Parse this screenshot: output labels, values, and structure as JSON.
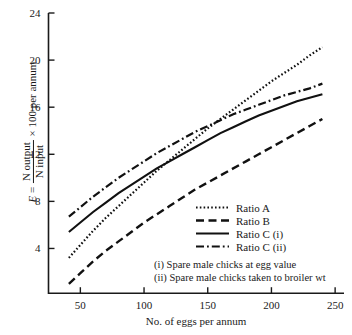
{
  "chart_data": {
    "type": "line",
    "title": "",
    "xlabel": "No. of eggs per annum",
    "ylabel": "E = N output / N input × 100 per annum",
    "ylabel_parts": {
      "symbol": "E",
      "equals": "=",
      "numerator": "N output",
      "denominator": "N input",
      "tail": "× 100 per annum"
    },
    "xlim": [
      25,
      255
    ],
    "ylim": [
      0.2,
      24
    ],
    "grid": false,
    "xticks": [
      50,
      100,
      150,
      200,
      250
    ],
    "yticks": [
      4,
      8,
      12,
      16,
      20,
      24
    ],
    "legend_position": "center-right",
    "series": [
      {
        "name": "Ratio A",
        "style": "dotted",
        "x": [
          41,
          50,
          60,
          70,
          80,
          90,
          100,
          110,
          120,
          130,
          140,
          150,
          160,
          170,
          180,
          190,
          200,
          210,
          220,
          230,
          240
        ],
        "y": [
          3.2,
          4.3,
          5.5,
          6.6,
          7.6,
          8.6,
          9.6,
          10.6,
          11.5,
          12.4,
          13.3,
          14.2,
          15.0,
          15.8,
          16.6,
          17.4,
          18.2,
          18.9,
          19.6,
          20.4,
          21.1
        ]
      },
      {
        "name": "Ratio B",
        "style": "dashed",
        "x": [
          41,
          50,
          60,
          70,
          80,
          90,
          100,
          110,
          120,
          130,
          140,
          150,
          160,
          170,
          180,
          190,
          200,
          210,
          220,
          230,
          240
        ],
        "y": [
          1.0,
          1.9,
          2.9,
          3.8,
          4.6,
          5.4,
          6.2,
          6.9,
          7.6,
          8.3,
          9.0,
          9.6,
          10.2,
          10.8,
          11.4,
          12.0,
          12.6,
          13.2,
          13.8,
          14.4,
          15.0
        ]
      },
      {
        "name": "Ratio C (i)",
        "style": "solid",
        "x": [
          41,
          50,
          60,
          70,
          80,
          90,
          100,
          110,
          120,
          130,
          140,
          150,
          160,
          170,
          180,
          190,
          200,
          210,
          220,
          230,
          240
        ],
        "y": [
          5.4,
          6.2,
          7.1,
          7.9,
          8.7,
          9.4,
          10.1,
          10.8,
          11.4,
          12.0,
          12.6,
          13.2,
          13.8,
          14.3,
          14.8,
          15.3,
          15.7,
          16.1,
          16.5,
          16.8,
          17.1
        ]
      },
      {
        "name": "Ratio C (ii)",
        "style": "dashdot",
        "x": [
          41,
          50,
          60,
          70,
          80,
          90,
          100,
          110,
          120,
          130,
          140,
          150,
          160,
          170,
          180,
          190,
          200,
          210,
          220,
          230,
          240
        ],
        "y": [
          6.7,
          7.5,
          8.4,
          9.2,
          10.0,
          10.7,
          11.4,
          12.1,
          12.7,
          13.3,
          13.9,
          14.4,
          14.9,
          15.4,
          15.8,
          16.2,
          16.6,
          17.0,
          17.3,
          17.6,
          18.0
        ]
      }
    ],
    "notes": [
      "(i)  Spare male chicks at egg value",
      "(ii) Spare male chicks taken to broiler wt"
    ]
  },
  "legend": {
    "items": [
      {
        "label": "Ratio A"
      },
      {
        "label": "Ratio B"
      },
      {
        "label": "Ratio C (i)"
      },
      {
        "label": "Ratio C (ii)"
      }
    ]
  }
}
